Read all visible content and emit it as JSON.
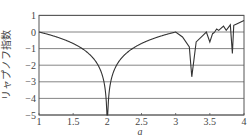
{
  "chart_data": {
    "type": "line",
    "title": "",
    "xlabel": "a",
    "ylabel": "リャプノフ指数",
    "xlim": [
      1,
      4
    ],
    "ylim": [
      -5,
      1
    ],
    "x_ticks": [
      "1",
      "1.5",
      "2",
      "2.5",
      "3",
      "3.5",
      "4"
    ],
    "y_ticks": [
      "1",
      "0",
      "−1",
      "−2",
      "−3",
      "−4",
      "−5"
    ],
    "grid": "horizontal",
    "legend": null,
    "series": [
      {
        "name": "Lyapunov exponent (logistic map)",
        "x": [
          1.0,
          1.2,
          1.4,
          1.6,
          1.8,
          1.9,
          1.95,
          1.99,
          2.0,
          2.01,
          2.05,
          2.1,
          2.2,
          2.4,
          2.6,
          2.8,
          2.95,
          3.0,
          3.1,
          3.2,
          3.236,
          3.3,
          3.4,
          3.449,
          3.5,
          3.54,
          3.56,
          3.57,
          3.6,
          3.63,
          3.7,
          3.74,
          3.8,
          3.83,
          3.85,
          3.9,
          4.0
        ],
        "y": [
          0.0,
          -0.22,
          -0.51,
          -0.92,
          -1.61,
          -2.3,
          -3.0,
          -4.6,
          -5.0,
          -4.6,
          -3.0,
          -2.3,
          -1.61,
          -0.92,
          -0.51,
          -0.22,
          -0.05,
          0.0,
          -0.3,
          -0.9,
          -2.7,
          -0.6,
          -0.2,
          0.0,
          -0.6,
          -0.1,
          -0.05,
          0.0,
          0.18,
          0.1,
          0.35,
          0.1,
          0.43,
          -1.3,
          0.4,
          0.5,
          0.69
        ]
      }
    ]
  },
  "colors": {
    "line": "#333333",
    "grid": "#666666",
    "background": "#ffffff"
  }
}
